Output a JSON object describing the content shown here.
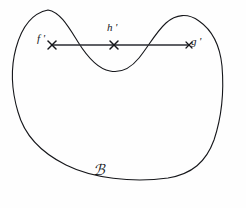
{
  "figure": {
    "background_color": "#fefefe",
    "ink_color": "#15161a",
    "width": 246,
    "height": 208
  },
  "region": {
    "name": "region-a",
    "label": "ℬ",
    "label_text": "A",
    "label_style": "script",
    "stroke_color": "#15161a",
    "stroke_width": 1.1,
    "fill": "none",
    "label_position": {
      "x": 93,
      "y": 163
    }
  },
  "chord": {
    "name": "horizontal-chord",
    "stroke_color": "#2b2d33",
    "stroke_width": 1.3,
    "y": 45,
    "x_start": 52,
    "x_end": 189
  },
  "points": [
    {
      "id": "f-prime",
      "label": "f '",
      "marker": "x-marker",
      "x": 52,
      "y": 45,
      "label_x": 37,
      "label_y": 33,
      "label_placement": "left"
    },
    {
      "id": "h-prime",
      "label": "h '",
      "marker": "x-marker",
      "x": 114,
      "y": 45,
      "label_x": 107,
      "label_y": 22,
      "label_placement": "above"
    },
    {
      "id": "g-prime",
      "label": "g '",
      "marker": "x-marker",
      "x": 189,
      "y": 45,
      "label_x": 191,
      "label_y": 36,
      "label_placement": "right"
    }
  ],
  "curve": {
    "description": "Hand-drawn closed blob: two rounded humps across the top separated by a central valley, smooth rounded left side, long flat bottom, steep right side.",
    "path": "M 48 10 C 33 13, 22 26, 16 48 C 10 70, 12 92, 18 112 C 24 134, 40 152, 66 165 C 92 178, 132 183, 168 178 C 192 174, 206 162, 214 140 C 222 116, 224 90, 222 66 C 220 46, 212 30, 199 21 C 188 13, 176 14, 166 23 C 156 32, 148 47, 139 58 C 130 69, 120 73, 110 71 C 98 69, 88 58, 78 42 C 68 26, 60 12, 48 10 Z"
  }
}
